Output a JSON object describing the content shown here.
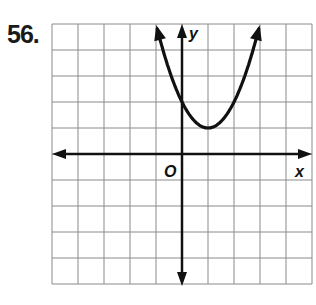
{
  "problem": {
    "number": "56."
  },
  "chart_data": {
    "type": "line",
    "title": "",
    "xlabel": "x",
    "ylabel": "y",
    "origin_label": "O",
    "xlim": [
      -5,
      5
    ],
    "ylim": [
      -5,
      5
    ],
    "grid": true,
    "grid_step": 1,
    "function": "y = (x - 1)^2 + 1",
    "series": [
      {
        "name": "parabola",
        "x": [
          -1,
          0,
          1,
          2,
          3
        ],
        "y": [
          5,
          2,
          1,
          2,
          5
        ]
      }
    ],
    "vertex": [
      1,
      1
    ],
    "y_intercept": 2
  },
  "colors": {
    "grid": "#8a8a8a",
    "axis": "#111111",
    "curve": "#111111"
  }
}
